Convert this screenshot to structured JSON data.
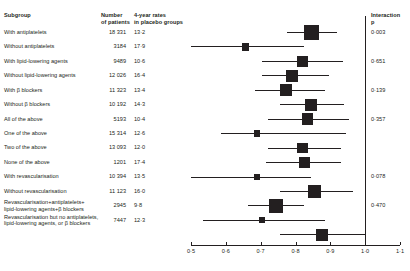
{
  "header": {
    "subgroup": "Subgroup",
    "number": "Number\nof patients",
    "rates": "4-year rates\nin placebo groups",
    "interaction": "Interaction\np"
  },
  "chart_data": {
    "type": "forest",
    "title": "",
    "xlabel": "",
    "ylabel": "",
    "xlim": [
      0.5,
      1.1
    ],
    "xticks": [
      0.5,
      0.6,
      0.7,
      0.8,
      0.9,
      1.0,
      1.1
    ],
    "xticklabels": [
      "0·5",
      "0·6",
      "0·7",
      "0·8",
      "0·9",
      "1·0",
      "1·1"
    ],
    "null_value": 1.0,
    "grid": false,
    "legend": "none",
    "rows": [
      {
        "label": "With antiplatelets",
        "number": "18 331",
        "rate": "13·2",
        "p": "0·003",
        "effect": 0.845,
        "ci_low": 0.775,
        "ci_high": 0.92,
        "weight": 1.0
      },
      {
        "label": "Without antiplatelets",
        "number": "3184",
        "rate": "17·9",
        "p": "",
        "effect": 0.657,
        "ci_low": 0.5,
        "ci_high": 0.825,
        "weight": 0.17
      },
      {
        "label": "With lipid-lowering agents",
        "number": "9489",
        "rate": "10·6",
        "p": "0·651",
        "effect": 0.82,
        "ci_low": 0.705,
        "ci_high": 0.935,
        "weight": 0.45
      },
      {
        "label": "Without lipid-lowering agents",
        "number": "12 026",
        "rate": "16·4",
        "p": "",
        "effect": 0.79,
        "ci_low": 0.705,
        "ci_high": 0.895,
        "weight": 0.62
      },
      {
        "label": "With β blockers",
        "number": "11 323",
        "rate": "13·4",
        "p": "0·139",
        "effect": 0.772,
        "ci_low": 0.685,
        "ci_high": 0.885,
        "weight": 0.55
      },
      {
        "label": "Without β blockers",
        "number": "10 192",
        "rate": "14·3",
        "p": "",
        "effect": 0.845,
        "ci_low": 0.755,
        "ci_high": 0.94,
        "weight": 0.58
      },
      {
        "label": "All of the above",
        "number": "5193",
        "rate": "10·4",
        "p": "0·357",
        "effect": 0.835,
        "ci_low": 0.72,
        "ci_high": 0.955,
        "weight": 0.52
      },
      {
        "label": "One of the above",
        "number": "15 314",
        "rate": "12·6",
        "p": "",
        "effect": 0.69,
        "ci_low": 0.585,
        "ci_high": 0.945,
        "weight": 0.1
      },
      {
        "label": "Two of the above",
        "number": "13 093",
        "rate": "12·0",
        "p": "",
        "effect": 0.82,
        "ci_low": 0.72,
        "ci_high": 0.93,
        "weight": 0.42
      },
      {
        "label": "None of the above",
        "number": "1201",
        "rate": "17·4",
        "p": "",
        "effect": 0.825,
        "ci_low": 0.715,
        "ci_high": 0.93,
        "weight": 0.42
      },
      {
        "label": "With revascularisation",
        "number": "10 394",
        "rate": "13·5",
        "p": "0·078",
        "effect": 0.69,
        "ci_low": 0.5,
        "ci_high": 0.845,
        "weight": 0.1
      },
      {
        "label": "Without revascularisation",
        "number": "11 123",
        "rate": "16·0",
        "p": "",
        "effect": 0.855,
        "ci_low": 0.755,
        "ci_high": 0.965,
        "weight": 0.7
      },
      {
        "label": "Revascularisation+antiplatelets+\nlipid-lowering agents+β blockers",
        "number": "2945",
        "rate": "9·8",
        "p": "0·470",
        "effect": 0.745,
        "ci_low": 0.665,
        "ci_high": 0.825,
        "weight": 0.82
      },
      {
        "label": "Revascularisation but no antiplatelets,\nlipid-lowering agents, or β blockers",
        "number": "7447",
        "rate": "12·3",
        "p": "",
        "effect": 0.705,
        "ci_low": 0.535,
        "ci_high": 0.885,
        "weight": 0.08
      },
      {
        "label": "",
        "number": "",
        "rate": "",
        "p": "",
        "effect": 0.875,
        "ci_low": 0.755,
        "ci_high": 1.0,
        "weight": 0.55
      }
    ]
  }
}
